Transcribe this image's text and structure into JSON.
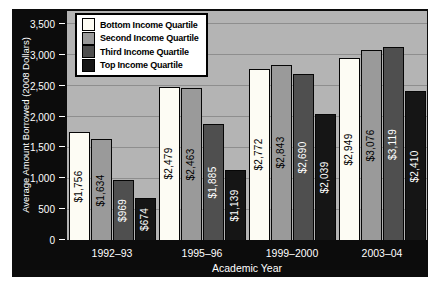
{
  "chart_data": {
    "type": "bar",
    "title": "",
    "xlabel": "Academic Year",
    "ylabel": "Average Amount Borrowed (2008 Dollars)",
    "categories": [
      "1992–93",
      "1995–96",
      "1999–2000",
      "2003–04"
    ],
    "series": [
      {
        "name": "Bottom Income Quartile",
        "values": [
          1756,
          2479,
          2772,
          2949
        ],
        "labels": [
          "$1,756",
          "$2,479",
          "$2,772",
          "$2,949"
        ],
        "color": "#fdfcf4",
        "label_color": "#000000"
      },
      {
        "name": "Second Income Quartile",
        "values": [
          1634,
          2463,
          2843,
          3076
        ],
        "labels": [
          "$1,634",
          "$2,463",
          "$2,843",
          "$3,076"
        ],
        "color": "#9a9a9a",
        "label_color": "#000000"
      },
      {
        "name": "Third Income Quartile",
        "values": [
          969,
          1885,
          2690,
          3119
        ],
        "labels": [
          "$969",
          "$1,885",
          "$2,690",
          "$3,119"
        ],
        "color": "#4f4f4f",
        "label_color": "#ffffff"
      },
      {
        "name": "Top Income Quartile",
        "values": [
          674,
          1139,
          2039,
          2410
        ],
        "labels": [
          "$674",
          "$1,139",
          "$2,039",
          "$2,410"
        ],
        "color": "#151515",
        "label_color": "#ffffff"
      }
    ],
    "yticks": [
      {
        "value": 0,
        "label": "0"
      },
      {
        "value": 500,
        "label": "500"
      },
      {
        "value": 1000,
        "label": "1,000"
      },
      {
        "value": 1500,
        "label": "1,500"
      },
      {
        "value": 2000,
        "label": "2,000"
      },
      {
        "value": 2500,
        "label": "2,500"
      },
      {
        "value": 3000,
        "label": "3,000"
      },
      {
        "value": 3500,
        "label": "3,500"
      }
    ],
    "ylim": [
      0,
      3710
    ],
    "grid": "horizontal",
    "legend_position": "top-left"
  },
  "colors": {
    "page_bg": "#ffffff",
    "chart_bg": "#0c0c0c",
    "plot_bg": "#b4b4b4",
    "gridline": "#8e8e8e",
    "axis_text": "#ffffff",
    "legend_bg": "#ffffff",
    "legend_border": "#000000",
    "legend_text": "#000000"
  }
}
